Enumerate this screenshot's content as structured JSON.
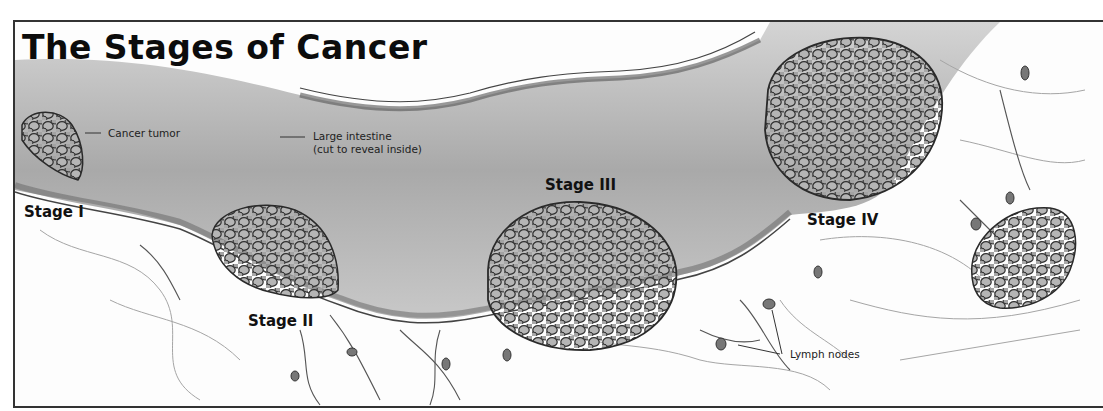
{
  "title": "The Stages of Cancer",
  "labels": {
    "cancer_tumor": "Cancer tumor",
    "large_intestine_line1": "Large intestine",
    "large_intestine_line2": "(cut to reveal inside)",
    "lymph_nodes": "Lymph nodes"
  },
  "stages": [
    {
      "label": "Stage I",
      "tumor_size": "small"
    },
    {
      "label": "Stage II",
      "tumor_size": "medium"
    },
    {
      "label": "Stage III",
      "tumor_size": "large"
    },
    {
      "label": "Stage IV",
      "tumor_size": "large, spread"
    }
  ],
  "colors": {
    "frame": "#333333",
    "intestine_interior": "#b8b8b8",
    "tumor_fill": "#8a8a8a",
    "tumor_outline": "#2a2a2a",
    "tissue_lines": "#9a9a9a",
    "text": "#111111"
  }
}
